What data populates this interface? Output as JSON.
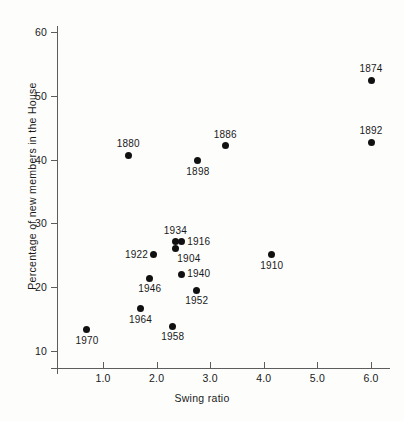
{
  "chart_data": {
    "type": "scatter",
    "title": "",
    "xlabel": "Swing ratio",
    "ylabel": "Percentage of new members in the House",
    "xlim": [
      0.27,
      6.45
    ],
    "ylim": [
      8.4,
      62.6
    ],
    "grid": false,
    "legend": "none",
    "xticks": [
      "1.0",
      "2.0",
      "3.0",
      "4.0",
      "5.0",
      "6.0"
    ],
    "xtick_values": [
      1.0,
      2.0,
      3.0,
      4.0,
      5.0,
      6.0
    ],
    "yticks": [
      "60",
      "50",
      "40",
      "30",
      "20",
      "10"
    ],
    "ytick_values": [
      60,
      50,
      40,
      30,
      20,
      10
    ],
    "point_label_field": "year",
    "points": [
      {
        "year": "1874",
        "x": 6.0,
        "y": 52.4,
        "label_pos": "above"
      },
      {
        "year": "1892",
        "x": 6.0,
        "y": 42.7,
        "label_pos": "above"
      },
      {
        "year": "1886",
        "x": 3.28,
        "y": 42.2,
        "label_pos": "above"
      },
      {
        "year": "1880",
        "x": 1.47,
        "y": 40.7,
        "label_pos": "above"
      },
      {
        "year": "1898",
        "x": 2.77,
        "y": 39.8,
        "label_pos": "below"
      },
      {
        "year": "1934",
        "x": 2.35,
        "y": 27.1,
        "label_pos": "above"
      },
      {
        "year": "1916",
        "x": 2.46,
        "y": 27.1,
        "label_pos": "right"
      },
      {
        "year": "1904",
        "x": 2.35,
        "y": 26.0,
        "label_pos": "below-right"
      },
      {
        "year": "1922",
        "x": 1.95,
        "y": 25.1,
        "label_pos": "left"
      },
      {
        "year": "1910",
        "x": 4.15,
        "y": 25.1,
        "label_pos": "below"
      },
      {
        "year": "1940",
        "x": 2.46,
        "y": 22.0,
        "label_pos": "right"
      },
      {
        "year": "1946",
        "x": 1.87,
        "y": 21.4,
        "label_pos": "below"
      },
      {
        "year": "1952",
        "x": 2.75,
        "y": 19.5,
        "label_pos": "below"
      },
      {
        "year": "1964",
        "x": 1.7,
        "y": 16.6,
        "label_pos": "below"
      },
      {
        "year": "1958",
        "x": 2.3,
        "y": 13.9,
        "label_pos": "below"
      },
      {
        "year": "1970",
        "x": 0.7,
        "y": 13.3,
        "label_pos": "below"
      }
    ]
  },
  "colors": {
    "marker": "#111111",
    "axis": "#5d5d5d",
    "text": "#1a1a1a",
    "background": "#fdfdfc"
  }
}
